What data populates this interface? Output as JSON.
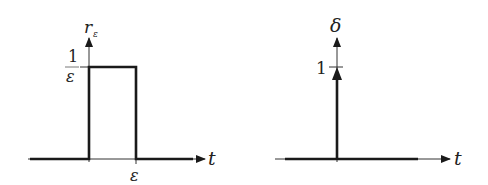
{
  "diagram": {
    "left_plot": {
      "title": "rectangular pulse",
      "y_axis_label": "r",
      "y_axis_label_sub": "ε",
      "x_axis_label": "t",
      "height_label_num": "1",
      "height_label_den": "ε",
      "width_label": "ε"
    },
    "right_plot": {
      "title": "dirac delta",
      "y_axis_label": "δ",
      "x_axis_label": "t",
      "impulse_label": "1"
    },
    "colors": {
      "line": "#1a1a1a",
      "axis": "#333333",
      "text": "#222222"
    }
  }
}
